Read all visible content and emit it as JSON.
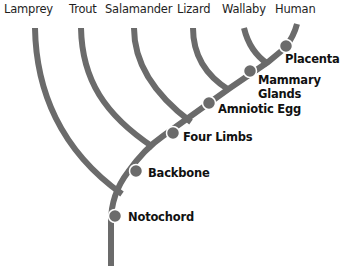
{
  "diagram": {
    "type": "cladogram",
    "colors": {
      "branch": "#6b6b6b",
      "node": "#6b6b6b",
      "text": "#111111",
      "background": "#ffffff"
    },
    "taxa": [
      {
        "name": "Lamprey"
      },
      {
        "name": "Trout"
      },
      {
        "name": "Salamander"
      },
      {
        "name": "Lizard"
      },
      {
        "name": "Wallaby"
      },
      {
        "name": "Human"
      }
    ],
    "traits": [
      {
        "label": "Notochord"
      },
      {
        "label": "Backbone"
      },
      {
        "label": "Four Limbs"
      },
      {
        "label": "Amniotic Egg"
      },
      {
        "label": "Mammary",
        "label2": "Glands"
      },
      {
        "label": "Placenta"
      }
    ]
  }
}
